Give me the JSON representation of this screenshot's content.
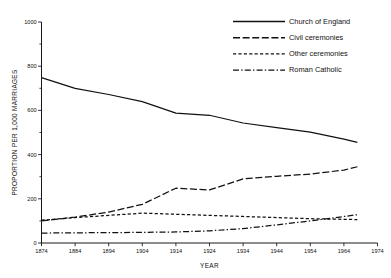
{
  "chart_data": {
    "type": "line",
    "title": "",
    "xlabel": "YEAR",
    "ylabel": "PROPORTION PER 1,000 MARRIAGES",
    "xlim": [
      1874,
      1974
    ],
    "ylim": [
      0,
      1000
    ],
    "x_ticks": [
      1874,
      1884,
      1894,
      1904,
      1914,
      1924,
      1934,
      1944,
      1954,
      1964,
      1974
    ],
    "y_ticks": [
      0,
      200,
      400,
      600,
      800,
      1000
    ],
    "y_minor_ticks": [
      100,
      300,
      500,
      700,
      900
    ],
    "grid": false,
    "legend_position": "top-right",
    "x": [
      1874,
      1884,
      1894,
      1904,
      1914,
      1924,
      1934,
      1944,
      1954,
      1964,
      1968
    ],
    "series": [
      {
        "name": "Church of England",
        "linestyle": "solid",
        "values": [
          748,
          700,
          672,
          640,
          588,
          578,
          543,
          522,
          502,
          470,
          455
        ]
      },
      {
        "name": "Civil ceremonies",
        "linestyle": "long-dash",
        "values": [
          100,
          117,
          140,
          175,
          248,
          240,
          290,
          302,
          312,
          330,
          345
        ]
      },
      {
        "name": "Other ceremonies",
        "linestyle": "short-dash",
        "values": [
          103,
          115,
          125,
          135,
          130,
          125,
          120,
          115,
          110,
          107,
          106
        ]
      },
      {
        "name": "Roman Catholic",
        "linestyle": "dash-dot",
        "values": [
          45,
          46,
          47,
          48,
          50,
          55,
          65,
          82,
          100,
          120,
          128
        ]
      }
    ]
  },
  "axes": {
    "x_title": "YEAR",
    "y_title": "PROPORTION PER 1,000 MARRIAGES",
    "x_tick_labels": [
      "1874",
      "1884",
      "1894",
      "1904",
      "1914",
      "1924",
      "1934",
      "1944",
      "1954",
      "1964",
      "1974"
    ],
    "y_tick_labels": [
      "0",
      "200",
      "400",
      "600",
      "800",
      "1000"
    ]
  },
  "legend": {
    "items": [
      {
        "label": "Church of England",
        "style": "solid"
      },
      {
        "label": "Civil ceremonies",
        "style": "long-dash"
      },
      {
        "label": "Other ceremonies",
        "style": "short-dash"
      },
      {
        "label": "Roman Catholic",
        "style": "dash-dot"
      }
    ]
  },
  "colors": {
    "ink": "#111111",
    "background": "#ffffff"
  }
}
